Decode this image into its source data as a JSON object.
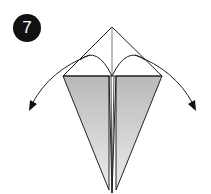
{
  "step": {
    "number": "7"
  },
  "diagram": {
    "colors": {
      "line": "#222222",
      "fill_top": "#b9b9b9",
      "fill_bottom": "#ececec",
      "background": "#ffffff",
      "badge": "#111111",
      "badge_text": "#ffffff"
    },
    "icons": {
      "left_arrow": "curved-arrow-down-left-icon",
      "right_arrow": "curved-arrow-down-right-icon"
    }
  }
}
